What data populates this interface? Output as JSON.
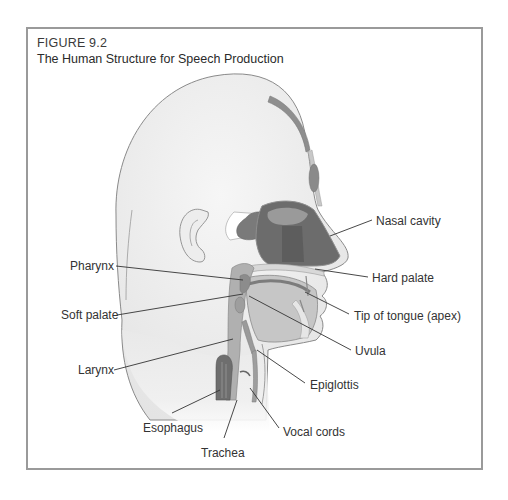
{
  "figure": {
    "number": "FIGURE 9.2",
    "title": "The Human Structure for Speech Production"
  },
  "colors": {
    "frame_border": "#9a9a9a",
    "skin_fill": "#ececec",
    "skin_outline": "#8a8a8a",
    "tissue_light": "#d4d4d4",
    "tissue_mid": "#a9a9a9",
    "cavity_dark": "#6e6e6e",
    "cavity_darker": "#5a5a5a",
    "leader_line": "#333333",
    "label_text": "#333333"
  },
  "labels": [
    {
      "id": "nasal-cavity",
      "text": "Nasal cavity",
      "x": 376,
      "y": 214
    },
    {
      "id": "hard-palate",
      "text": "Hard palate",
      "x": 372,
      "y": 271
    },
    {
      "id": "pharynx",
      "text": "Pharynx",
      "x": 70,
      "y": 259
    },
    {
      "id": "soft-palate",
      "text": "Soft palate",
      "x": 61,
      "y": 308
    },
    {
      "id": "tip-of-tongue",
      "text": "Tip of tongue (apex)",
      "x": 354,
      "y": 309
    },
    {
      "id": "uvula",
      "text": "Uvula",
      "x": 355,
      "y": 344
    },
    {
      "id": "larynx",
      "text": "Larynx",
      "x": 78,
      "y": 363
    },
    {
      "id": "epiglottis",
      "text": "Epiglottis",
      "x": 310,
      "y": 378
    },
    {
      "id": "esophagus",
      "text": "Esophagus",
      "x": 143,
      "y": 421
    },
    {
      "id": "vocal-cords",
      "text": "Vocal cords",
      "x": 283,
      "y": 425
    },
    {
      "id": "trachea",
      "text": "Trachea",
      "x": 201,
      "y": 446
    }
  ],
  "leaders": [
    {
      "id": "nasal-cavity",
      "x1": 372,
      "y1": 220,
      "x2": 330,
      "y2": 236
    },
    {
      "id": "hard-palate",
      "x1": 368,
      "y1": 277,
      "x2": 315,
      "y2": 269
    },
    {
      "id": "pharynx",
      "x1": 116,
      "y1": 266,
      "x2": 243,
      "y2": 280
    },
    {
      "id": "soft-palate",
      "x1": 117,
      "y1": 315,
      "x2": 243,
      "y2": 294
    },
    {
      "id": "tip-of-tongue",
      "x1": 349,
      "y1": 314,
      "x2": 305,
      "y2": 292
    },
    {
      "id": "uvula",
      "x1": 351,
      "y1": 350,
      "x2": 249,
      "y2": 296
    },
    {
      "id": "larynx",
      "x1": 114,
      "y1": 370,
      "x2": 233,
      "y2": 339
    },
    {
      "id": "epiglottis",
      "x1": 305,
      "y1": 383,
      "x2": 257,
      "y2": 350
    },
    {
      "id": "esophagus",
      "x1": 172,
      "y1": 413,
      "x2": 220,
      "y2": 390
    },
    {
      "id": "vocal-cords",
      "x1": 279,
      "y1": 428,
      "x2": 250,
      "y2": 388
    },
    {
      "id": "trachea",
      "x1": 224,
      "y1": 438,
      "x2": 237,
      "y2": 400
    }
  ]
}
